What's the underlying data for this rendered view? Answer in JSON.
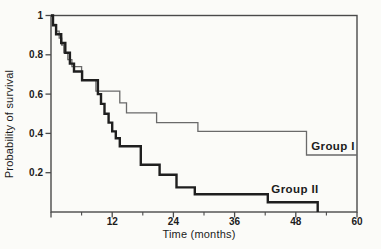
{
  "figure": {
    "background_color": "#fbfbf8",
    "axis_color": "#4a4a4a",
    "text_color": "#1c1c1c",
    "thin_curve_color": "#6a6a6a",
    "thick_curve_color": "#1f1f1f"
  },
  "chart_data": {
    "type": "line",
    "curve_style": "step-post",
    "title": "",
    "xlabel": "Time (months)",
    "ylabel": "Probability of survival",
    "xlim": [
      0,
      60
    ],
    "ylim": [
      0,
      1
    ],
    "grid": false,
    "legend_position": "inline-labels-right",
    "x_major_ticks": [
      0,
      12,
      24,
      36,
      48,
      60
    ],
    "x_major_tick_labels": [
      "",
      "12",
      "24",
      "36",
      "48",
      "60"
    ],
    "x_minor_ticks": [
      6,
      18,
      30,
      42,
      54
    ],
    "y_ticks": [
      1,
      0.8,
      0.6,
      0.4,
      0.2
    ],
    "y_tick_labels": [
      "1",
      "0.8",
      "0.6",
      "0.4",
      "0.2"
    ],
    "series": [
      {
        "name": "Group I",
        "line_weight": "thin",
        "color": "#6a6a6a",
        "stroke_width": 1.3,
        "end_time": 60,
        "points": [
          [
            0,
            1.0
          ],
          [
            0.4,
            0.955
          ],
          [
            1.0,
            0.92
          ],
          [
            1.6,
            0.885
          ],
          [
            2.1,
            0.85
          ],
          [
            2.5,
            0.81
          ],
          [
            3.3,
            0.775
          ],
          [
            4.1,
            0.74
          ],
          [
            6.0,
            0.67
          ],
          [
            8.8,
            0.615
          ],
          [
            13.5,
            0.555
          ],
          [
            14.8,
            0.505
          ],
          [
            20.7,
            0.455
          ],
          [
            28.8,
            0.41
          ],
          [
            50.1,
            0.29
          ]
        ]
      },
      {
        "name": "Group II",
        "line_weight": "thick",
        "color": "#1f1f1f",
        "stroke_width": 2.4,
        "end_time": 52.3,
        "points": [
          [
            0,
            1.0
          ],
          [
            0.4,
            0.95
          ],
          [
            1.0,
            0.905
          ],
          [
            2.0,
            0.86
          ],
          [
            2.8,
            0.81
          ],
          [
            3.7,
            0.755
          ],
          [
            4.5,
            0.715
          ],
          [
            6.1,
            0.67
          ],
          [
            9.2,
            0.6
          ],
          [
            9.8,
            0.55
          ],
          [
            10.5,
            0.5
          ],
          [
            11.3,
            0.455
          ],
          [
            12.0,
            0.41
          ],
          [
            12.7,
            0.375
          ],
          [
            13.5,
            0.335
          ],
          [
            17.6,
            0.24
          ],
          [
            21.3,
            0.19
          ],
          [
            24.6,
            0.125
          ],
          [
            28.2,
            0.09
          ],
          [
            42.5,
            0.05
          ],
          [
            52.3,
            0.0
          ]
        ]
      }
    ]
  }
}
